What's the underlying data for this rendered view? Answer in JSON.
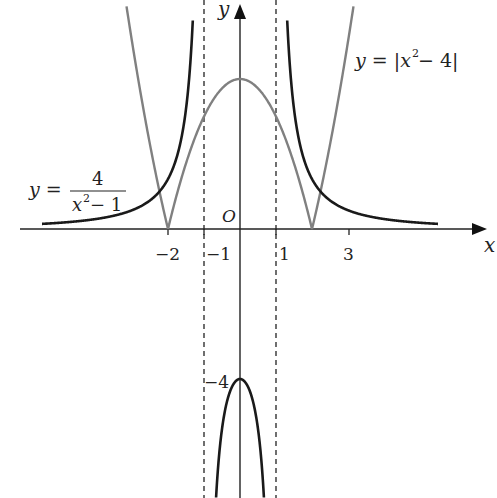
{
  "chart_data": {
    "type": "line",
    "title": "",
    "xlabel": "x",
    "ylabel": "y",
    "origin_label": "O",
    "x_ticks": [
      {
        "value": -2,
        "label": "-2"
      },
      {
        "value": -1,
        "label": "-1"
      },
      {
        "value": 1,
        "label": "1"
      },
      {
        "value": 3,
        "label": "3"
      }
    ],
    "y_ticks": [
      {
        "value": -4,
        "label": "-4"
      }
    ],
    "asymptotes": [
      {
        "x": -1,
        "style": "dashed"
      },
      {
        "x": 1,
        "style": "dashed"
      }
    ],
    "grid": false,
    "series": [
      {
        "name": "y = 4/(x^2 - 1)",
        "formula": "4/(x^2-1)",
        "color": "#1a1a1a",
        "branches": [
          [
            -5.5,
            -1.02
          ],
          [
            -0.9,
            0.9
          ],
          [
            1.02,
            5.5
          ]
        ],
        "sample_points": [
          [
            -5.5,
            0.14
          ],
          [
            -3,
            0.5
          ],
          [
            -2,
            1.33
          ],
          [
            -1.5,
            3.2
          ],
          [
            0,
            -4
          ],
          [
            1.5,
            3.2
          ],
          [
            2,
            1.33
          ],
          [
            3,
            0.5
          ],
          [
            5.5,
            0.14
          ]
        ]
      },
      {
        "name": "y = |x^2 - 4|",
        "formula": "abs(x^2-4)",
        "color": "#808080",
        "sample_points": [
          [
            -3.2,
            6.24
          ],
          [
            -2,
            0
          ],
          [
            -1,
            3
          ],
          [
            0,
            4
          ],
          [
            1,
            3
          ],
          [
            2,
            0
          ],
          [
            3.2,
            6.24
          ]
        ]
      }
    ],
    "annotations": [
      {
        "text": "y = 4 / (x² − 1)",
        "position": "left"
      },
      {
        "text": "y = |x² − 4|",
        "position": "upper-right"
      }
    ]
  },
  "labels": {
    "x_axis": "x",
    "y_axis": "y",
    "origin": "O",
    "tick_m2": "−2",
    "tick_m1": "−1",
    "tick_1": "1",
    "tick_3": "3",
    "tick_m4": "−4",
    "eq1_lhs": "y =",
    "eq1_num": "4",
    "eq1_den_x": "x",
    "eq1_den_exp": "2",
    "eq1_den_rest": " − 1",
    "eq2_lhs": "y = |",
    "eq2_x": "x",
    "eq2_exp": "2",
    "eq2_rest": " − 4|"
  }
}
